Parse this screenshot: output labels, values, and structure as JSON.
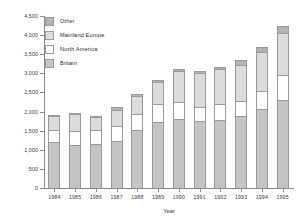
{
  "chart_data": {
    "type": "bar",
    "stacked": true,
    "title": "",
    "xlabel": "Year",
    "ylabel": "",
    "ylim": [
      0,
      4500
    ],
    "ytick_step": 500,
    "ytick_labels": [
      "0",
      "500",
      "1,000",
      "1,500",
      "2,000",
      "2,500",
      "3,000",
      "3,500",
      "4,000",
      "4,500"
    ],
    "ytick_values": [
      0,
      500,
      1000,
      1500,
      2000,
      2500,
      3000,
      3500,
      4000,
      4500
    ],
    "grid": false,
    "legend_position": "top-left",
    "categories": [
      "1984",
      "1985",
      "1986",
      "1987",
      "1988",
      "1989",
      "1990",
      "1991",
      "1992",
      "1993",
      "1994",
      "1995"
    ],
    "series": [
      {
        "name": "Britain",
        "color": "#c4c4c4",
        "values": [
          1200,
          1120,
          1140,
          1240,
          1520,
          1730,
          1800,
          1750,
          1780,
          1880,
          2060,
          2310
        ]
      },
      {
        "name": "North America",
        "color": "#ffffff",
        "values": [
          320,
          370,
          370,
          390,
          410,
          470,
          440,
          360,
          410,
          410,
          490,
          640
        ]
      },
      {
        "name": "Mainland Europe",
        "color": "#dcdcdc",
        "values": [
          360,
          440,
          350,
          420,
          470,
          570,
          810,
          900,
          930,
          920,
          1010,
          1100
        ]
      },
      {
        "name": "Other",
        "color": "#b4b4b4",
        "values": [
          30,
          40,
          30,
          60,
          50,
          50,
          60,
          50,
          60,
          150,
          140,
          200
        ]
      }
    ],
    "totals": [
      1910,
      1970,
      1890,
      2110,
      2450,
      2820,
      3110,
      3060,
      3180,
      3360,
      3700,
      4250
    ]
  },
  "legend": {
    "items": [
      {
        "label": "Other",
        "swatch": "other"
      },
      {
        "label": "Mainland Europe",
        "swatch": "mainland"
      },
      {
        "label": "North America",
        "swatch": "north-america"
      },
      {
        "label": "Britain",
        "swatch": "britain"
      }
    ]
  }
}
